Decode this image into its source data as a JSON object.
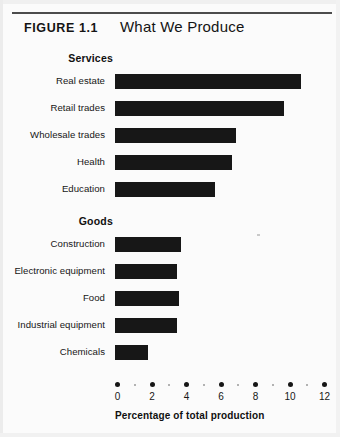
{
  "figure": {
    "number_label": "FIGURE 1.1",
    "title": "What We Produce"
  },
  "chart_data": {
    "type": "bar",
    "orientation": "horizontal",
    "title": "What We Produce",
    "xlabel": "Percentage of total production",
    "ylabel": "",
    "xlim": [
      0,
      12
    ],
    "xticks": [
      0,
      2,
      4,
      6,
      8,
      10,
      12
    ],
    "xtick_labels": [
      "0",
      "2",
      "4",
      "6",
      "8",
      "10",
      "12"
    ],
    "minor_ticks": [
      1,
      3,
      5,
      7,
      9,
      11
    ],
    "grid": false,
    "legend": false,
    "bar_color": "#171717",
    "groups": [
      {
        "name": "Services",
        "categories": [
          "Real estate",
          "Retail trades",
          "Wholesale trades",
          "Health",
          "Education"
        ],
        "values": [
          10.8,
          9.8,
          7.0,
          6.8,
          5.8
        ]
      },
      {
        "name": "Goods",
        "categories": [
          "Construction",
          "Electronic equipment",
          "Food",
          "Industrial equipment",
          "Chemicals"
        ],
        "values": [
          3.8,
          3.6,
          3.7,
          3.6,
          1.9
        ]
      }
    ]
  }
}
